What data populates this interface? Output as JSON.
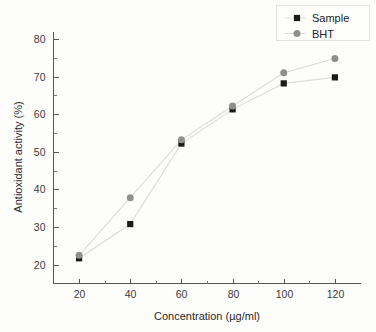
{
  "chart_data": {
    "type": "line",
    "title": "",
    "xlabel": "Concentration (µg/ml)",
    "ylabel": "Antioxidant activity (%)",
    "x": [
      20,
      40,
      60,
      80,
      100,
      120
    ],
    "xlim": [
      10,
      130
    ],
    "ylim": [
      15,
      82
    ],
    "xticks": [
      20,
      40,
      60,
      80,
      100,
      120
    ],
    "xtick_labels": [
      "20",
      "40",
      "60",
      "80",
      "100",
      "120"
    ],
    "yticks": [
      20,
      30,
      40,
      50,
      60,
      70,
      80
    ],
    "ytick_labels": [
      "20",
      "30",
      "40",
      "50",
      "60",
      "70",
      "80"
    ],
    "x_minor_ticks": [
      30,
      50,
      70,
      90,
      110
    ],
    "y_minor_ticks": [
      25,
      35,
      45,
      55,
      65,
      75
    ],
    "grid": false,
    "legend_position": "top-right",
    "series": [
      {
        "name": "Sample",
        "marker": "square",
        "color": "#1a1a1a",
        "line_color": "#dcdcdc",
        "values": [
          21.7,
          30.8,
          52.2,
          61.3,
          68.2,
          69.8
        ]
      },
      {
        "name": "BHT",
        "marker": "circle",
        "color": "#8f8f8f",
        "line_color": "#dcdcdc",
        "values": [
          22.5,
          37.8,
          53.2,
          62.2,
          71.0,
          74.8
        ]
      }
    ]
  },
  "legend": {
    "entries": [
      {
        "label": "Sample"
      },
      {
        "label": "BHT"
      }
    ]
  },
  "axes": {
    "x_title": "Concentration (µg/ml)",
    "y_title": "Antioxidant activity (%)"
  }
}
